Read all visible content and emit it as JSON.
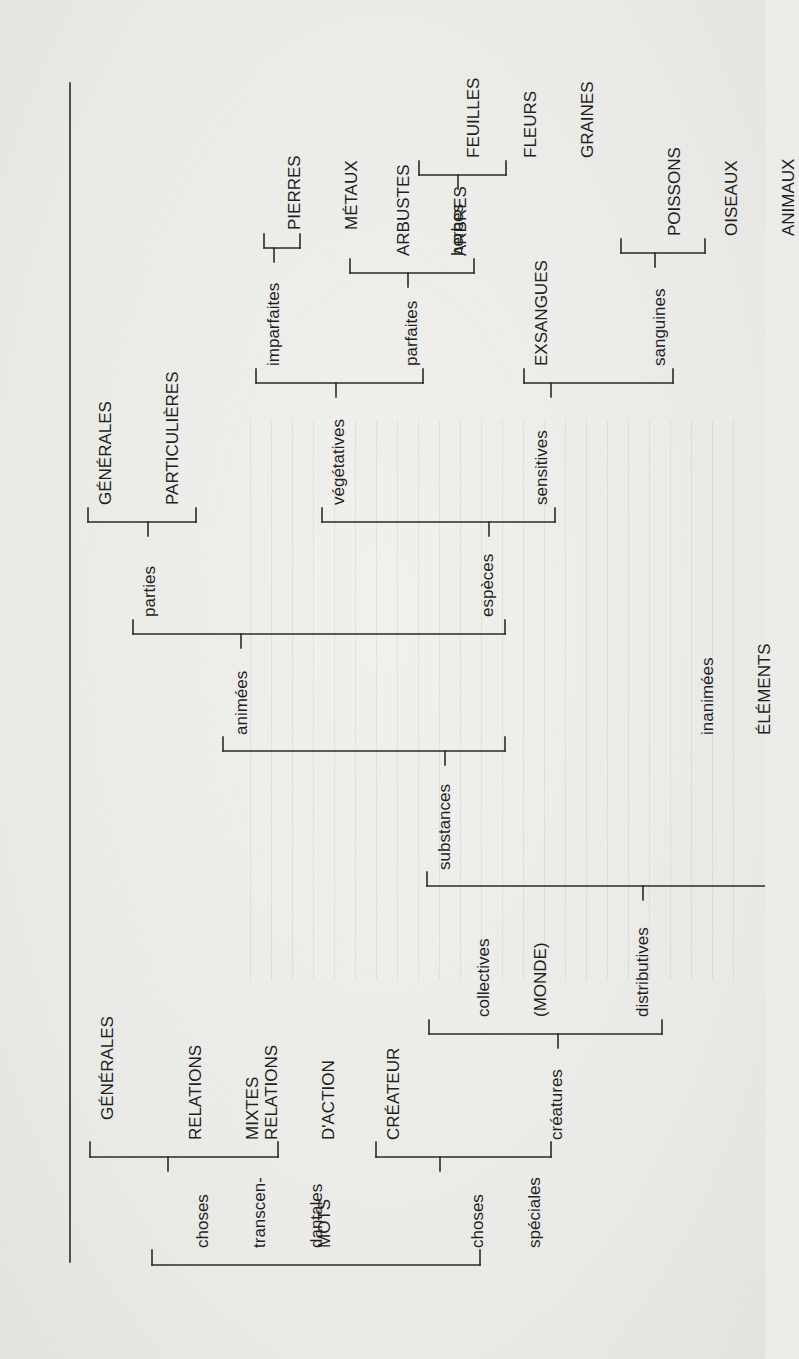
{
  "diagram": {
    "orientation": "rotated-90-ccw",
    "root": "MOTS",
    "nodes": {
      "mots": "MOTS",
      "choses_transcendantales": [
        "choses",
        "transcen-",
        "dantales"
      ],
      "generales_top": "GÉNÉRALES",
      "relations_mixtes": [
        "RELATIONS",
        "MIXTES"
      ],
      "relations_action": [
        "RELATIONS",
        "D'ACTION"
      ],
      "choses_speciales": [
        "choses",
        "spéciales"
      ],
      "createur": "CRÉATEUR",
      "creatures": "créatures",
      "collectives": [
        "collectives",
        "(MONDE)"
      ],
      "distributives": "distributives",
      "substances": "substances",
      "animees": "animées",
      "inanimees": [
        "inanimées",
        "ÉLÉMENTS"
      ],
      "parties": "parties",
      "generales_parties": "GÉNÉRALES",
      "particulieres": "PARTICULIÈRES",
      "especes": "espèces",
      "vegetatives": "végétatives",
      "sensitives": "sensitives",
      "imparfaites": "imparfaites",
      "pierres_metaux": [
        "PIERRES",
        "MÉTAUX"
      ],
      "parfaites": "parfaites",
      "arbustes_arbres": [
        "ARBUSTES",
        "ARBRES"
      ],
      "herbes": "herbes",
      "feuilles_fleurs_graines": [
        "FEUILLES",
        "FLEURS",
        "GRAINES"
      ],
      "exsangues": "EXSANGUES",
      "sanguines": "sanguines",
      "poissons_oiseaux_animaux": [
        "POISSONS",
        "OISEAUX",
        "ANIMAUX"
      ]
    },
    "colors": {
      "ink": "#1f1f1f",
      "paper": "#ebebe8"
    }
  }
}
